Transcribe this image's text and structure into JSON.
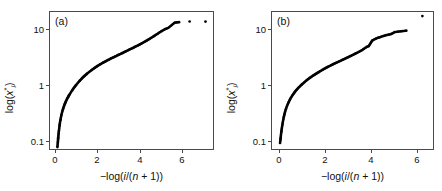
{
  "figure": {
    "panels": [
      {
        "tag": "(a)",
        "xlabel": "−log(i/(n + 1))",
        "ylabel": "log(x*i)",
        "xticks": [
          "0",
          "2",
          "4",
          "6"
        ],
        "yticks": [
          "0.1",
          "1",
          "10"
        ]
      },
      {
        "tag": "(b)",
        "xlabel": "−log(i/(n + 1))",
        "ylabel": "log(x*i)",
        "xticks": [
          "0",
          "2",
          "4",
          "6"
        ],
        "yticks": [
          "0.1",
          "1",
          "10"
        ]
      }
    ]
  },
  "chart_data": [
    {
      "type": "scatter",
      "title": "(a)",
      "xlabel": "-log(i/(n + 1))",
      "ylabel": "log(x*_i)",
      "xlim": [
        -0.35,
        7.45
      ],
      "ylim": [
        0.085,
        26.0
      ],
      "yscale": "log",
      "xticks": [
        0,
        2,
        4,
        6
      ],
      "yticks": [
        0.1,
        1,
        10
      ],
      "grid": false,
      "legend": null,
      "marker": "dot",
      "x": [
        0.0,
        0.02,
        0.04,
        0.06,
        0.08,
        0.1,
        0.12,
        0.14,
        0.16,
        0.18,
        0.2,
        0.23,
        0.26,
        0.29,
        0.32,
        0.35,
        0.38,
        0.42,
        0.46,
        0.5,
        0.54,
        0.58,
        0.62,
        0.66,
        0.7,
        0.75,
        0.8,
        0.85,
        0.9,
        0.95,
        1.0,
        1.06,
        1.12,
        1.18,
        1.24,
        1.3,
        1.36,
        1.42,
        1.48,
        1.54,
        1.6,
        1.67,
        1.74,
        1.81,
        1.88,
        1.95,
        2.02,
        2.09,
        2.16,
        2.23,
        2.3,
        2.38,
        2.46,
        2.54,
        2.62,
        2.7,
        2.78,
        2.86,
        2.94,
        3.02,
        3.1,
        3.18,
        3.26,
        3.34,
        3.42,
        3.5,
        3.58,
        3.66,
        3.74,
        3.82,
        3.9,
        3.98,
        4.06,
        4.14,
        4.22,
        4.3,
        4.38,
        4.46,
        4.54,
        4.62,
        4.7,
        4.78,
        4.86,
        4.95,
        5.05,
        5.15,
        5.25,
        5.55,
        5.75,
        6.25,
        7.0
      ],
      "y": [
        0.1,
        0.12,
        0.15,
        0.18,
        0.21,
        0.24,
        0.27,
        0.3,
        0.33,
        0.36,
        0.39,
        0.43,
        0.47,
        0.51,
        0.55,
        0.59,
        0.63,
        0.68,
        0.73,
        0.78,
        0.83,
        0.88,
        0.93,
        0.98,
        1.03,
        1.1,
        1.17,
        1.24,
        1.31,
        1.38,
        1.45,
        1.54,
        1.63,
        1.72,
        1.81,
        1.9,
        1.99,
        2.08,
        2.17,
        2.26,
        2.35,
        2.46,
        2.57,
        2.68,
        2.79,
        2.9,
        3.01,
        3.12,
        3.23,
        3.34,
        3.45,
        3.58,
        3.71,
        3.84,
        3.97,
        4.1,
        4.25,
        4.4,
        4.55,
        4.7,
        4.85,
        5.02,
        5.2,
        5.38,
        5.56,
        5.75,
        5.95,
        6.16,
        6.38,
        6.6,
        6.85,
        7.12,
        7.4,
        7.7,
        8.0,
        8.35,
        8.7,
        9.1,
        9.5,
        9.95,
        10.4,
        10.9,
        11.4,
        12.0,
        12.6,
        13.1,
        13.6,
        16.8,
        17.1,
        17.6,
        17.5
      ]
    },
    {
      "type": "scatter",
      "title": "(b)",
      "xlabel": "-log(i/(n + 1))",
      "ylabel": "log(x*_i)",
      "xlim": [
        -0.35,
        6.75
      ],
      "ylim": [
        0.085,
        34.0
      ],
      "yscale": "log",
      "xticks": [
        0,
        2,
        4,
        6
      ],
      "yticks": [
        0.1,
        1,
        10
      ],
      "grid": false,
      "legend": null,
      "marker": "dot",
      "x": [
        0.0,
        0.02,
        0.04,
        0.06,
        0.08,
        0.1,
        0.13,
        0.16,
        0.19,
        0.22,
        0.25,
        0.29,
        0.33,
        0.37,
        0.41,
        0.45,
        0.5,
        0.55,
        0.6,
        0.65,
        0.7,
        0.76,
        0.82,
        0.88,
        0.94,
        1.0,
        1.07,
        1.14,
        1.21,
        1.28,
        1.35,
        1.42,
        1.49,
        1.56,
        1.63,
        1.7,
        1.78,
        1.86,
        1.94,
        2.02,
        2.1,
        2.18,
        2.26,
        2.34,
        2.42,
        2.5,
        2.58,
        2.66,
        2.74,
        2.82,
        2.9,
        2.98,
        3.06,
        3.14,
        3.22,
        3.3,
        3.38,
        3.46,
        3.54,
        3.62,
        3.7,
        3.78,
        3.86,
        4.02,
        4.1,
        4.18,
        4.26,
        4.34,
        4.42,
        4.52,
        4.62,
        4.72,
        4.85,
        5.0,
        5.15,
        5.5,
        6.2
      ],
      "y": [
        0.12,
        0.14,
        0.17,
        0.2,
        0.23,
        0.26,
        0.31,
        0.36,
        0.41,
        0.46,
        0.51,
        0.57,
        0.63,
        0.69,
        0.75,
        0.81,
        0.88,
        0.95,
        1.02,
        1.09,
        1.16,
        1.24,
        1.32,
        1.4,
        1.48,
        1.56,
        1.66,
        1.76,
        1.86,
        1.96,
        2.06,
        2.16,
        2.26,
        2.36,
        2.46,
        2.57,
        2.7,
        2.83,
        2.96,
        3.09,
        3.22,
        3.35,
        3.48,
        3.62,
        3.76,
        3.9,
        4.05,
        4.2,
        4.36,
        4.52,
        4.7,
        4.88,
        5.07,
        5.27,
        5.48,
        5.7,
        5.93,
        6.18,
        6.45,
        6.8,
        7.2,
        7.55,
        7.8,
        10.0,
        10.4,
        10.8,
        11.2,
        11.4,
        11.8,
        12.1,
        12.5,
        12.8,
        13.2,
        14.3,
        14.6,
        15.2,
        28.5
      ]
    }
  ]
}
